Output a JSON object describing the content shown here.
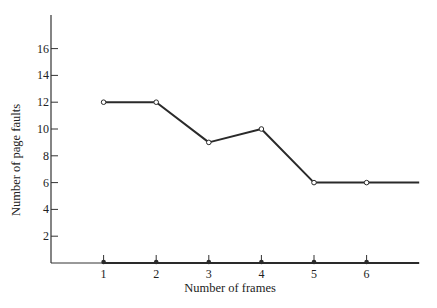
{
  "chart_data": {
    "type": "line",
    "title": "",
    "xlabel": "Number of frames",
    "ylabel": "Number of page faults",
    "x": [
      1,
      2,
      3,
      4,
      5,
      6
    ],
    "x_tick_labels": [
      "1",
      "2",
      "3",
      "4",
      "5",
      "6"
    ],
    "y_tick_labels": [
      "2",
      "4",
      "6",
      "8",
      "10",
      "12",
      "14",
      "16"
    ],
    "ylim": [
      0,
      18
    ],
    "xlim": [
      -0.0,
      7.0
    ],
    "grid": false,
    "legend": null,
    "series": [
      {
        "name": "page faults",
        "values": [
          12,
          12,
          9,
          10,
          6,
          6
        ],
        "marker": "open-circle",
        "extends_right_to_x": 7.0,
        "extends_right_value": 6
      },
      {
        "name": "baseline",
        "values": [
          0,
          0,
          0,
          0,
          0,
          0
        ],
        "marker": "filled-dot-with-tick",
        "extends_right_to_x": 7.0
      }
    ],
    "colors": {
      "line": "#2a2a2a",
      "axis": "#333333",
      "background": "#ffffff"
    }
  }
}
